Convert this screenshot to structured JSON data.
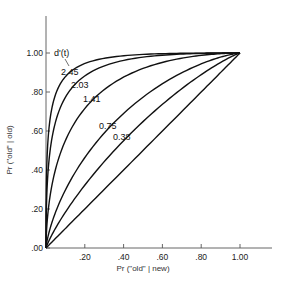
{
  "chart_data": {
    "type": "line",
    "title": "",
    "xlabel": "Pr (\"old\" | new)",
    "ylabel": "Pr (\"old\" | old)",
    "xlim": [
      0,
      1
    ],
    "ylim": [
      0,
      1
    ],
    "grid": false,
    "x_ticks": [
      ".20",
      ".40",
      ".60",
      ".80",
      "1.00"
    ],
    "y_ticks": [
      ".00",
      ".20",
      ".40",
      ".60",
      ".80",
      "1.00"
    ],
    "legend_title": "d'(t)",
    "series": [
      {
        "name": "2.45",
        "d_prime": 2.45
      },
      {
        "name": "2.03",
        "d_prime": 2.03
      },
      {
        "name": "1.41",
        "d_prime": 1.41
      },
      {
        "name": "0.75",
        "d_prime": 0.75
      },
      {
        "name": "0.38",
        "d_prime": 0.38
      },
      {
        "name": "chance",
        "d_prime": 0
      }
    ],
    "curve_labels": [
      "2.45",
      "2.03",
      "1.41",
      "0.75",
      "0.38"
    ]
  }
}
